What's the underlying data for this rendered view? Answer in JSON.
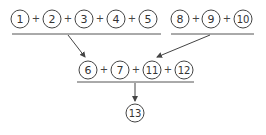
{
  "diagram": {
    "group_a": {
      "nodes": [
        "1",
        "2",
        "3",
        "4",
        "5"
      ],
      "operator": "+"
    },
    "group_b": {
      "nodes": [
        "8",
        "9",
        "10"
      ],
      "operator": "+"
    },
    "middle_row": {
      "nodes": [
        "6",
        "7",
        "11",
        "12"
      ],
      "operator": "+"
    },
    "result": {
      "node": "13"
    },
    "colors": {
      "stroke": "#444444",
      "text": "#333333",
      "background": "#ffffff"
    }
  }
}
